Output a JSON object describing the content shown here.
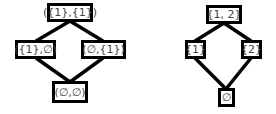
{
  "diagrams": [
    {
      "name": "product-lattice",
      "nodes": {
        "top": "({1},{1})",
        "left": "({1},∅)",
        "right": "(∅,{1})",
        "bottom": "(∅,∅)"
      }
    },
    {
      "name": "powerset-lattice",
      "nodes": {
        "top": "{1, 2}",
        "left": "{1}",
        "right": "{2}",
        "bottom": "∅"
      }
    }
  ],
  "colors": {
    "stroke": "#000000",
    "text": "#444444",
    "background": "#ffffff"
  }
}
